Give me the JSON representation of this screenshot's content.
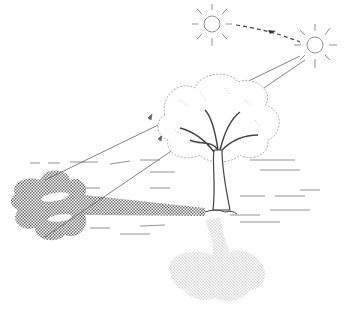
{
  "illustration": {
    "subject": "tree-shadow-sun-movement",
    "elements": [
      "sun-early",
      "sun-late",
      "sun-path-arrow",
      "sun-rays",
      "tree",
      "shadow-early",
      "shadow-late-reflection",
      "ground-lines"
    ]
  },
  "colors": {
    "line": "#555555",
    "shadow": "#8a8a8a",
    "faint_shadow": "#d8d8d8",
    "background": "#ffffff"
  }
}
